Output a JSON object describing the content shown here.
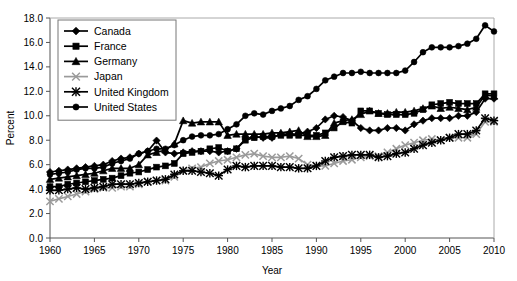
{
  "chart_data": {
    "type": "line",
    "title": "",
    "xlabel": "Year",
    "ylabel": "Percent",
    "xlim": [
      1960,
      2010
    ],
    "ylim": [
      0.0,
      18.0
    ],
    "xticks": [
      "1960",
      "1965",
      "1970",
      "1975",
      "1980",
      "1985",
      "1990",
      "1995",
      "2000",
      "2005",
      "2010"
    ],
    "yticks": [
      "0.0",
      "2.0",
      "4.0",
      "6.0",
      "8.0",
      "10.0",
      "12.0",
      "14.0",
      "16.0",
      "18.0"
    ],
    "grid": false,
    "legend_position": "top-left",
    "x": [
      1960,
      1961,
      1962,
      1963,
      1964,
      1965,
      1966,
      1967,
      1968,
      1969,
      1970,
      1971,
      1972,
      1973,
      1974,
      1975,
      1976,
      1977,
      1978,
      1979,
      1980,
      1981,
      1982,
      1983,
      1984,
      1985,
      1986,
      1987,
      1988,
      1989,
      1990,
      1991,
      1992,
      1993,
      1994,
      1995,
      1996,
      1997,
      1998,
      1999,
      2000,
      2001,
      2002,
      2003,
      2004,
      2005,
      2006,
      2007,
      2008,
      2009,
      2010
    ],
    "series": [
      {
        "name": "Canada",
        "marker": "diamond",
        "color": "#000000",
        "values": [
          5.4,
          5.5,
          5.6,
          5.7,
          5.8,
          5.9,
          6.0,
          6.3,
          6.5,
          6.6,
          6.9,
          7.1,
          7.97,
          7.0,
          6.9,
          7.0,
          7.1,
          7.1,
          7.1,
          7.0,
          7.1,
          7.3,
          8.1,
          8.3,
          8.2,
          8.2,
          8.5,
          8.5,
          8.5,
          8.7,
          9.0,
          9.7,
          10.0,
          9.9,
          9.6,
          9.0,
          8.8,
          8.8,
          9.0,
          9.0,
          8.8,
          9.3,
          9.6,
          9.8,
          9.8,
          9.8,
          10.0,
          10.0,
          10.3,
          11.4,
          11.4
        ]
      },
      {
        "name": "France",
        "marker": "square",
        "color": "#000000",
        "values": [
          4.2,
          4.2,
          4.4,
          4.5,
          4.6,
          4.7,
          4.8,
          4.9,
          5.1,
          5.3,
          5.4,
          5.6,
          5.8,
          5.9,
          6.1,
          6.9,
          7.0,
          7.1,
          7.3,
          7.4,
          7.1,
          7.3,
          8.0,
          8.2,
          8.3,
          8.3,
          8.4,
          8.4,
          8.4,
          8.4,
          8.4,
          8.6,
          9.0,
          9.5,
          9.4,
          10.4,
          10.4,
          10.2,
          10.1,
          10.1,
          10.1,
          10.2,
          10.5,
          10.9,
          11.0,
          11.1,
          11.0,
          11.0,
          11.0,
          11.8,
          11.8
        ]
      },
      {
        "name": "Germany",
        "marker": "triangle",
        "color": "#000000",
        "values": [
          4.8,
          4.9,
          5.0,
          5.1,
          5.2,
          5.3,
          5.5,
          5.7,
          5.7,
          5.7,
          6.0,
          6.8,
          7.0,
          7.2,
          7.7,
          9.6,
          9.4,
          9.5,
          9.5,
          9.5,
          8.4,
          8.5,
          8.5,
          8.5,
          8.5,
          8.6,
          8.6,
          8.7,
          8.8,
          8.3,
          8.3,
          8.4,
          9.4,
          9.6,
          9.7,
          10.1,
          10.4,
          10.2,
          10.2,
          10.3,
          10.3,
          10.4,
          10.6,
          10.8,
          10.6,
          10.7,
          10.6,
          10.5,
          10.7,
          11.7,
          11.6
        ]
      },
      {
        "name": "Japan",
        "marker": "x",
        "color": "#9a9a9a",
        "values": [
          3.0,
          3.2,
          3.4,
          3.6,
          3.8,
          4.0,
          4.1,
          4.1,
          4.2,
          4.2,
          4.4,
          4.6,
          4.7,
          4.7,
          5.0,
          5.5,
          5.7,
          5.8,
          6.1,
          6.3,
          6.4,
          6.6,
          6.8,
          6.9,
          6.7,
          6.6,
          6.6,
          6.7,
          6.5,
          6.0,
          5.9,
          5.9,
          6.1,
          6.3,
          6.4,
          6.6,
          6.7,
          6.7,
          7.0,
          7.3,
          7.6,
          7.8,
          8.0,
          8.1,
          8.0,
          8.2,
          8.2,
          8.2,
          8.5,
          9.5,
          9.5
        ]
      },
      {
        "name": "United Kingdom",
        "marker": "star",
        "color": "#000000",
        "values": [
          3.9,
          3.9,
          4.0,
          4.1,
          4.0,
          4.1,
          4.2,
          4.4,
          4.4,
          4.4,
          4.5,
          4.6,
          4.7,
          4.8,
          5.2,
          5.5,
          5.5,
          5.4,
          5.3,
          5.1,
          5.6,
          5.9,
          5.8,
          5.9,
          5.9,
          5.9,
          5.8,
          5.8,
          5.7,
          5.7,
          5.9,
          6.3,
          6.6,
          6.7,
          6.8,
          6.8,
          6.8,
          6.6,
          6.7,
          6.9,
          7.0,
          7.3,
          7.6,
          7.8,
          8.0,
          8.2,
          8.5,
          8.5,
          8.8,
          9.8,
          9.6
        ]
      },
      {
        "name": "United States",
        "marker": "circle",
        "color": "#000000",
        "values": [
          5.2,
          5.3,
          5.4,
          5.6,
          5.7,
          5.7,
          5.8,
          6.1,
          6.3,
          6.5,
          6.9,
          7.1,
          7.3,
          7.3,
          7.6,
          8.0,
          8.3,
          8.4,
          8.4,
          8.5,
          8.9,
          9.3,
          10.0,
          10.2,
          10.1,
          10.4,
          10.6,
          10.8,
          11.3,
          11.6,
          12.2,
          12.9,
          13.2,
          13.5,
          13.5,
          13.6,
          13.5,
          13.5,
          13.5,
          13.5,
          13.7,
          14.4,
          15.2,
          15.6,
          15.6,
          15.6,
          15.7,
          15.9,
          16.3,
          17.4,
          16.9
        ]
      }
    ],
    "legend": [
      {
        "label": "Canada",
        "marker": "diamond",
        "color": "#000000"
      },
      {
        "label": "France",
        "marker": "square",
        "color": "#000000"
      },
      {
        "label": "Germany",
        "marker": "triangle",
        "color": "#000000"
      },
      {
        "label": "Japan",
        "marker": "x",
        "color": "#9a9a9a"
      },
      {
        "label": "United Kingdom",
        "marker": "star",
        "color": "#000000"
      },
      {
        "label": "United States",
        "marker": "circle",
        "color": "#000000"
      }
    ]
  }
}
